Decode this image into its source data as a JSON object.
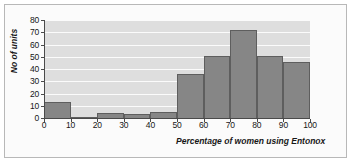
{
  "chart_data": {
    "type": "bar",
    "title": "",
    "xlabel": "Percentage of women using Entonox",
    "ylabel": "No of units",
    "categories": [
      "0-10",
      "10-20",
      "20-30",
      "30-40",
      "40-50",
      "50-60",
      "60-70",
      "70-80",
      "80-90",
      "90-100"
    ],
    "values": [
      13,
      1,
      4,
      3,
      5,
      36,
      51,
      72,
      51,
      46
    ],
    "xticks": [
      "0",
      "10",
      "20",
      "30",
      "40",
      "50",
      "60",
      "70",
      "80",
      "90",
      "100"
    ],
    "yticks": [
      "0",
      "10",
      "20",
      "30",
      "40",
      "50",
      "60",
      "70",
      "80"
    ],
    "xlim": [
      0,
      100
    ],
    "ylim": [
      0,
      80
    ],
    "grid": "horizontal",
    "legend": "none",
    "colors": {
      "bar_fill": "#868686",
      "bar_border": "#5e5e5e",
      "plot_background": "#dedede",
      "gridline": "#fbfbfb",
      "axis": "#4a4a4a",
      "frame_border": "#b8b8b8",
      "page_background": "#fbfbfb",
      "text": "#171717"
    }
  }
}
